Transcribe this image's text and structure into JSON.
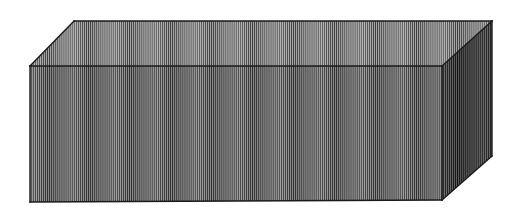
{
  "figure": {
    "shape_name": "rectangular-prism",
    "canvas": {
      "width": 507,
      "height": 220,
      "background": "#ffffff"
    },
    "outline_color": "#1a1a1a",
    "outline_width": 1.4,
    "faces": [
      {
        "name": "top-face",
        "label": "Top face",
        "points": "74,21 492,21 442,66 30,66",
        "fill": "#b4b4b4",
        "hatch_color": "#3c3c3c",
        "hatch_spacing": 2.05,
        "hatch_width": 0.85,
        "hatch_orientation": "vertical"
      },
      {
        "name": "front-face",
        "label": "Front face",
        "points": "30,66 442,66 442,200 30,202",
        "fill": "#a0a0a0",
        "hatch_color": "#2e2e2e",
        "hatch_spacing": 2.05,
        "hatch_width": 0.95,
        "hatch_orientation": "vertical"
      },
      {
        "name": "right-face",
        "label": "Right side face",
        "points": "442,66 492,21 492,156 442,200",
        "fill": "#6e6e6e",
        "hatch_color": "#141414",
        "hatch_spacing": 2.05,
        "hatch_width": 1.0,
        "hatch_orientation": "vertical"
      }
    ],
    "edges": [
      {
        "name": "edge-top-back",
        "x1": 74,
        "y1": 21,
        "x2": 492,
        "y2": 21
      },
      {
        "name": "edge-top-right-slant",
        "x1": 492,
        "y1": 21,
        "x2": 442,
        "y2": 66
      },
      {
        "name": "edge-top-front",
        "x1": 442,
        "y1": 66,
        "x2": 30,
        "y2": 66
      },
      {
        "name": "edge-top-left-slant",
        "x1": 30,
        "y1": 66,
        "x2": 74,
        "y2": 21
      },
      {
        "name": "edge-front-left",
        "x1": 30,
        "y1": 66,
        "x2": 30,
        "y2": 202
      },
      {
        "name": "edge-front-bottom",
        "x1": 30,
        "y1": 202,
        "x2": 442,
        "y2": 200
      },
      {
        "name": "edge-front-right",
        "x1": 442,
        "y1": 66,
        "x2": 442,
        "y2": 200
      },
      {
        "name": "edge-right-vertical",
        "x1": 492,
        "y1": 21,
        "x2": 492,
        "y2": 156
      },
      {
        "name": "edge-right-bottom",
        "x1": 492,
        "y1": 156,
        "x2": 442,
        "y2": 200
      }
    ],
    "vertices": [
      {
        "name": "vertex-top-back-left",
        "x": 74,
        "y": 21
      },
      {
        "name": "vertex-top-back-right",
        "x": 492,
        "y": 21
      },
      {
        "name": "vertex-top-front-right",
        "x": 442,
        "y": 66
      },
      {
        "name": "vertex-top-front-left",
        "x": 30,
        "y": 66
      },
      {
        "name": "vertex-bottom-front-left",
        "x": 30,
        "y": 202
      },
      {
        "name": "vertex-bottom-front-right",
        "x": 442,
        "y": 200
      },
      {
        "name": "vertex-bottom-back-right",
        "x": 492,
        "y": 156
      }
    ]
  }
}
